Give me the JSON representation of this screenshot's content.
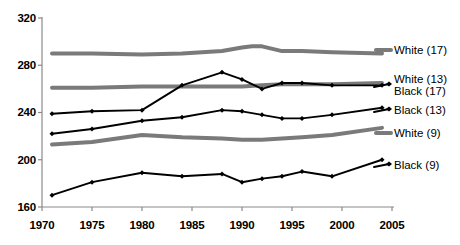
{
  "chart_data": {
    "type": "line",
    "title": "",
    "subtitle": "",
    "xlabel": "",
    "ylabel": "",
    "xlim": [
      1970,
      2005
    ],
    "ylim": [
      160,
      320
    ],
    "xticks": [
      1970,
      1975,
      1980,
      1985,
      1990,
      1995,
      2000,
      2005
    ],
    "yticks": [
      160,
      200,
      240,
      280,
      320
    ],
    "grid": false,
    "legend_position": "right-inline",
    "series": [
      {
        "name": "White  (17)",
        "style": "thick-gray-no-marker",
        "color": "#7a7a7a",
        "x": [
          1971,
          1975,
          1980,
          1984,
          1988,
          1990,
          1991,
          1992,
          1994,
          1996,
          1999,
          2004
        ],
        "values": [
          290,
          290,
          289,
          290,
          292,
          295,
          296,
          296,
          292,
          292,
          291,
          290
        ]
      },
      {
        "name": "White (13)",
        "style": "thick-gray-no-marker",
        "color": "#7a7a7a",
        "x": [
          1971,
          1975,
          1980,
          1984,
          1988,
          1990,
          1992,
          1994,
          1996,
          1999,
          2004
        ],
        "values": [
          261,
          261,
          262,
          262,
          262,
          262,
          263,
          264,
          264,
          264,
          265
        ]
      },
      {
        "name": "Black (17)",
        "style": "black-diamond-marker",
        "color": "#000000",
        "x": [
          1971,
          1975,
          1980,
          1984,
          1988,
          1990,
          1992,
          1994,
          1996,
          1999,
          2004
        ],
        "values": [
          239,
          241,
          242,
          263,
          274,
          268,
          260,
          265,
          265,
          263,
          263
        ]
      },
      {
        "name": "Black (13)",
        "style": "black-diamond-marker",
        "color": "#000000",
        "x": [
          1971,
          1975,
          1980,
          1984,
          1988,
          1990,
          1992,
          1994,
          1996,
          1999,
          2004
        ],
        "values": [
          222,
          226,
          233,
          236,
          242,
          241,
          238,
          235,
          235,
          238,
          244
        ]
      },
      {
        "name": "White (9)",
        "style": "thick-gray-no-marker",
        "color": "#7a7a7a",
        "x": [
          1971,
          1975,
          1980,
          1984,
          1988,
          1990,
          1992,
          1994,
          1996,
          1999,
          2004
        ],
        "values": [
          213,
          215,
          221,
          219,
          218,
          217,
          217,
          218,
          219,
          221,
          227
        ]
      },
      {
        "name": "Black (9)",
        "style": "black-diamond-marker",
        "color": "#000000",
        "x": [
          1971,
          1975,
          1980,
          1984,
          1988,
          1990,
          1992,
          1994,
          1996,
          1999,
          2004
        ],
        "values": [
          170,
          181,
          189,
          186,
          188,
          181,
          184,
          186,
          190,
          186,
          200
        ]
      }
    ]
  },
  "axis": {
    "y_labels": [
      "320",
      "280",
      "240",
      "200",
      "160"
    ],
    "x_labels": [
      "1970",
      "1975",
      "1980",
      "1985",
      "1990",
      "1995",
      "2000",
      "2005"
    ]
  },
  "legend": {
    "items": [
      {
        "label": "White  (17)",
        "series": "White  (17)"
      },
      {
        "label": "White (13)",
        "series": "White (13)"
      },
      {
        "label": "Black (17)",
        "series": "Black (17)"
      },
      {
        "label": "Black (13)",
        "series": "Black (13)"
      },
      {
        "label": "White (9)",
        "series": "White (9)"
      },
      {
        "label": "Black (9)",
        "series": "Black (9)"
      }
    ]
  },
  "colors": {
    "gray_series": "#7a7a7a",
    "black_series": "#000000",
    "axis": "#8a8a8a",
    "text": "#000000",
    "background": "#ffffff"
  }
}
